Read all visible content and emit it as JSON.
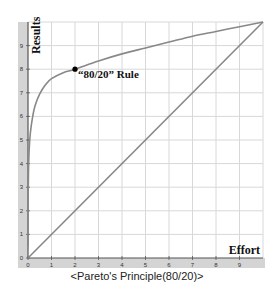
{
  "chart_data": {
    "type": "line",
    "title": "",
    "caption": "<Pareto's Principle(80/20)>",
    "xlabel": "Effort",
    "ylabel": "Results",
    "xlim": [
      0,
      10
    ],
    "ylim": [
      0,
      10
    ],
    "grid": true,
    "x_ticks": [
      "0",
      "1",
      "2",
      "3",
      "4",
      "5",
      "6",
      "7",
      "8",
      "9"
    ],
    "y_ticks": [
      "0",
      "1",
      "2",
      "3",
      "4",
      "5",
      "6",
      "7",
      "8",
      "9"
    ],
    "series": [
      {
        "name": "Pareto curve",
        "color": "#888888",
        "x": [
          0,
          0.02,
          0.05,
          0.1,
          0.2,
          0.3,
          0.5,
          0.75,
          1,
          1.5,
          2,
          3,
          4,
          5,
          6,
          7,
          8,
          9,
          10
        ],
        "y": [
          2.0,
          3.6,
          4.6,
          5.3,
          6.0,
          6.45,
          6.95,
          7.35,
          7.6,
          7.85,
          8.0,
          8.35,
          8.65,
          8.9,
          9.15,
          9.4,
          9.6,
          9.8,
          10.0
        ]
      },
      {
        "name": "Linear",
        "color": "#888888",
        "x": [
          0,
          10
        ],
        "y": [
          0,
          10
        ]
      }
    ],
    "annotations": [
      {
        "text": "“80/20” Rule",
        "x": 2,
        "y": 8,
        "marker": "dot"
      }
    ]
  }
}
